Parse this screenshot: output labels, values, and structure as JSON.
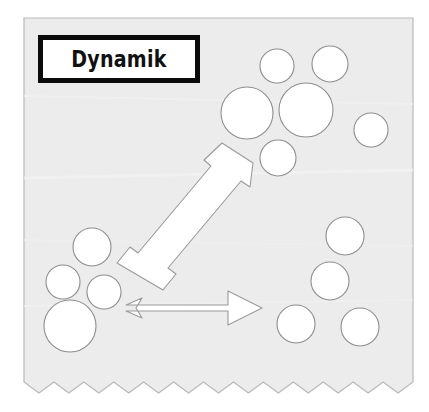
{
  "diagram": {
    "title": "Dynamik",
    "paper": {
      "background_color": "#ececec",
      "border_color": "#b9b9b9",
      "page_background": "#ffffff",
      "torn_edge": "zigzag-bottom-edge",
      "left": 24,
      "top": 18,
      "right": 413,
      "bottom": 382,
      "zigzag_teeth": 13,
      "zigzag_depth": 11
    },
    "title_box": {
      "label": "Dynamik",
      "border_color": "#0b0b0b",
      "fill_color": "#ffffff",
      "x": 38,
      "y": 35,
      "width": 162,
      "height": 48,
      "border_width": 5
    },
    "shape_style": {
      "circle_fill": "#ffffff",
      "circle_stroke": "#8e8e8e",
      "arrow_fill": "#ffffff",
      "arrow_stroke": "#9a9a9a",
      "stroke_width": 1.1
    },
    "clusters": [
      {
        "name": "source-cluster-left",
        "position": "lower-left",
        "count": 4,
        "circles": [
          {
            "name": "circle-src-1",
            "cx": 92,
            "cy": 247,
            "r": 19
          },
          {
            "name": "circle-src-2",
            "cx": 63,
            "cy": 282,
            "r": 17
          },
          {
            "name": "circle-src-3",
            "cx": 104,
            "cy": 292,
            "r": 17
          },
          {
            "name": "circle-src-4",
            "cx": 70,
            "cy": 326,
            "r": 26
          }
        ]
      },
      {
        "name": "target-cluster-upper-right",
        "position": "upper-right",
        "count": 6,
        "circles": [
          {
            "name": "circle-ur-1",
            "cx": 277,
            "cy": 66,
            "r": 17
          },
          {
            "name": "circle-ur-2",
            "cx": 330,
            "cy": 64,
            "r": 18
          },
          {
            "name": "circle-ur-3",
            "cx": 247,
            "cy": 113,
            "r": 26
          },
          {
            "name": "circle-ur-4",
            "cx": 306,
            "cy": 110,
            "r": 27
          },
          {
            "name": "circle-ur-5",
            "cx": 371,
            "cy": 130,
            "r": 17
          },
          {
            "name": "circle-ur-6",
            "cx": 278,
            "cy": 158,
            "r": 18
          }
        ]
      },
      {
        "name": "target-cluster-lower-right",
        "position": "lower-right",
        "count": 4,
        "circles": [
          {
            "name": "circle-lr-1",
            "cx": 345,
            "cy": 236,
            "r": 19
          },
          {
            "name": "circle-lr-2",
            "cx": 330,
            "cy": 281,
            "r": 19
          },
          {
            "name": "circle-lr-3",
            "cx": 296,
            "cy": 324,
            "r": 19
          },
          {
            "name": "circle-lr-4",
            "cx": 360,
            "cy": 327,
            "r": 19
          }
        ]
      }
    ],
    "arrows": [
      {
        "name": "arrow-diagonal-up-right",
        "direction": "up-right",
        "from": "source-cluster-left",
        "to": "target-cluster-upper-right",
        "points": "117,263 130,247 138,253 211,166 204,160 222,143 253,163 250,187 241,181 168,268 176,274 163,290"
      },
      {
        "name": "arrow-horizontal-right",
        "direction": "right",
        "from": "source-cluster-left",
        "to": "target-cluster-lower-right",
        "points": "126,305 142,298 136,308 142,318 126,311 228,311 228,325 262,308 228,291 228,305"
      }
    ]
  }
}
